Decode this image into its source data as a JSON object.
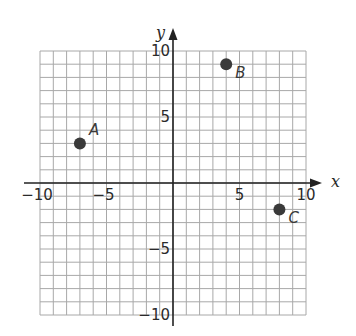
{
  "chart_data": {
    "type": "scatter",
    "title": "",
    "xlabel": "x",
    "ylabel": "y",
    "xlim": [
      -10,
      10
    ],
    "ylim": [
      -10,
      10
    ],
    "grid": true,
    "grid_step": 1,
    "x_ticks": [
      {
        "value": -10,
        "label": "−10"
      },
      {
        "value": -5,
        "label": "−5"
      },
      {
        "value": 5,
        "label": "5"
      },
      {
        "value": 10,
        "label": "10"
      }
    ],
    "y_ticks": [
      {
        "value": 10,
        "label": "10"
      },
      {
        "value": 5,
        "label": "5"
      },
      {
        "value": -5,
        "label": "−5"
      },
      {
        "value": -10,
        "label": "−10"
      }
    ],
    "points": [
      {
        "label": "A",
        "x": -7,
        "y": 3
      },
      {
        "label": "B",
        "x": 4,
        "y": 9
      },
      {
        "label": "C",
        "x": 8,
        "y": -2
      }
    ],
    "colors": {
      "grid": "#a8a8a8",
      "axis": "#222222",
      "point": "#3a3a3a"
    }
  }
}
